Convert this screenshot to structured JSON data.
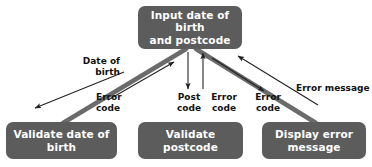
{
  "diagram": {
    "colors": {
      "node_fill": "#5c5c5c",
      "node_text": "#ffffff",
      "thick_flow": "#6b6b6b",
      "thin_arrow": "#222222",
      "background": "#ffffff",
      "label_text": "#111111"
    },
    "nodes": [
      {
        "id": "input",
        "name": "input-date-of-birth-and-postcode",
        "line1": "Input date of birth",
        "line2": "and postcode",
        "x": 138,
        "y": 6,
        "w": 104,
        "h": 43
      },
      {
        "id": "validate-dob",
        "name": "validate-date-of-birth",
        "line1": "Validate date of",
        "line2": "birth",
        "x": 6,
        "y": 122,
        "w": 111,
        "h": 37
      },
      {
        "id": "validate-postcode",
        "name": "validate-postcode",
        "line1": "Validate",
        "line2": "postcode",
        "x": 138,
        "y": 122,
        "w": 105,
        "h": 37
      },
      {
        "id": "display-error",
        "name": "display-error-message",
        "line1": "Display error",
        "line2": "message",
        "x": 262,
        "y": 122,
        "w": 104,
        "h": 37
      }
    ],
    "edge_labels": [
      {
        "id": "date-of-birth",
        "text": "Date of\nbirth",
        "x": 72,
        "y": 56,
        "w": 48,
        "align": "right"
      },
      {
        "id": "error-code-left",
        "text": "Error\ncode",
        "x": 96,
        "y": 92,
        "w": 38,
        "align": "left"
      },
      {
        "id": "post-code",
        "text": "Post\ncode",
        "x": 173,
        "y": 92,
        "w": 32,
        "align": "center"
      },
      {
        "id": "error-code-center",
        "text": "Error\ncode",
        "x": 207,
        "y": 92,
        "w": 34,
        "align": "center"
      },
      {
        "id": "error-code-right",
        "text": "Error\ncode",
        "x": 251,
        "y": 92,
        "w": 34,
        "align": "center"
      },
      {
        "id": "error-message",
        "text": "Error message",
        "x": 296,
        "y": 83,
        "w": 72,
        "align": "left"
      }
    ],
    "flows": [
      {
        "id": "flow-dob-thick",
        "from": "input",
        "to": "validate-dob",
        "label": "Date of birth",
        "style": "thick"
      },
      {
        "id": "flow-dob-out",
        "from": "input",
        "to": "validate-dob",
        "label": "Date of birth",
        "style": "thin"
      },
      {
        "id": "flow-dob-errorcode",
        "from": "validate-dob",
        "to": "input",
        "label": "Error code",
        "style": "thin"
      },
      {
        "id": "flow-postcode",
        "from": "input",
        "to": "validate-postcode",
        "label": "Post code",
        "style": "thin"
      },
      {
        "id": "flow-postcode-error",
        "from": "validate-postcode",
        "to": "input",
        "label": "Error code",
        "style": "thin"
      },
      {
        "id": "flow-error-thick",
        "from": "input",
        "to": "display-error",
        "label": "Error code",
        "style": "thick"
      },
      {
        "id": "flow-error-code-out",
        "from": "input",
        "to": "display-error",
        "label": "Error code",
        "style": "thin"
      },
      {
        "id": "flow-error-message",
        "from": "display-error",
        "to": "input",
        "label": "Error message",
        "style": "thin"
      }
    ]
  }
}
